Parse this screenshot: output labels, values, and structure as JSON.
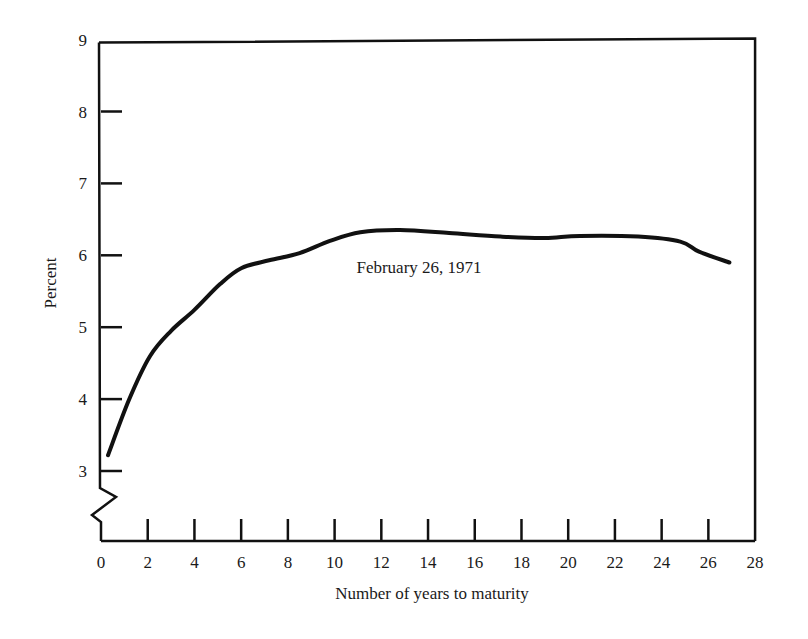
{
  "chart_data": {
    "type": "line",
    "title": "",
    "xlabel": "Number of years to maturity",
    "ylabel": "Percent",
    "xlim": [
      0,
      28
    ],
    "ylim": [
      3,
      9
    ],
    "y_axis_break": true,
    "grid": false,
    "legend": null,
    "x_ticks": [
      0,
      2,
      4,
      6,
      8,
      10,
      12,
      14,
      16,
      18,
      20,
      22,
      24,
      26,
      28
    ],
    "y_ticks": [
      3,
      4,
      5,
      6,
      7,
      8,
      9
    ],
    "annotations": [
      {
        "text": "February 26, 1971",
        "x": 16.5,
        "y": 5.9
      }
    ],
    "series": [
      {
        "name": "February 26, 1971",
        "x": [
          0.3,
          1.2,
          2.1,
          3.0,
          4.0,
          5.1,
          6.0,
          7.2,
          8.5,
          9.8,
          11.1,
          12.8,
          14.9,
          17.1,
          19.0,
          20.5,
          23.0,
          24.8,
          25.6,
          26.9
        ],
        "y": [
          3.22,
          3.99,
          4.6,
          4.95,
          5.24,
          5.6,
          5.82,
          5.93,
          6.03,
          6.2,
          6.32,
          6.35,
          6.31,
          6.26,
          6.24,
          6.27,
          6.26,
          6.19,
          6.05,
          5.9
        ]
      }
    ]
  },
  "labels": {
    "xlabel": "Number of years to maturity",
    "ylabel": "Percent",
    "annotation": "February 26, 1971"
  },
  "colors": {
    "line": "#111111",
    "background": "#ffffff"
  }
}
